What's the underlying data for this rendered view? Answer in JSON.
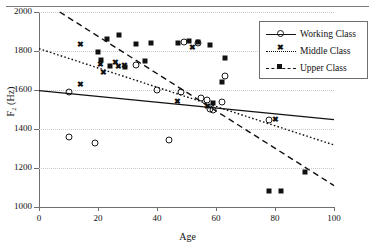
{
  "chart_data": {
    "type": "scatter",
    "title": "",
    "xlabel": "Age",
    "ylabel": "F2 (Hz)",
    "xlim": [
      0,
      100
    ],
    "ylim": [
      1000,
      2000
    ],
    "xticks": [
      0,
      20,
      40,
      60,
      80,
      100
    ],
    "yticks": [
      1000,
      1200,
      1400,
      1600,
      1800,
      2000
    ],
    "grid": true,
    "legend_position": "top-right",
    "series": [
      {
        "name": "Working Class",
        "marker": "open-circle",
        "line_style": "solid",
        "points": [
          {
            "x": 10,
            "y": 1592
          },
          {
            "x": 10,
            "y": 1358
          },
          {
            "x": 19,
            "y": 1327
          },
          {
            "x": 33,
            "y": 1729
          },
          {
            "x": 40,
            "y": 1598
          },
          {
            "x": 44,
            "y": 1345
          },
          {
            "x": 48,
            "y": 1588
          },
          {
            "x": 49,
            "y": 1847
          },
          {
            "x": 54,
            "y": 1840
          },
          {
            "x": 55,
            "y": 1560
          },
          {
            "x": 57,
            "y": 1548
          },
          {
            "x": 58,
            "y": 1502
          },
          {
            "x": 59,
            "y": 1498
          },
          {
            "x": 62,
            "y": 1537
          },
          {
            "x": 63,
            "y": 1672
          },
          {
            "x": 78,
            "y": 1448
          }
        ],
        "fit_line": {
          "x0": 0,
          "y0": 1597,
          "x1": 100,
          "y1": 1448
        }
      },
      {
        "name": "Middle Class",
        "marker": "cross",
        "line_style": "dotted",
        "points": [
          {
            "x": 14,
            "y": 1838
          },
          {
            "x": 14,
            "y": 1630
          },
          {
            "x": 21,
            "y": 1731
          },
          {
            "x": 22,
            "y": 1692
          },
          {
            "x": 26,
            "y": 1743
          },
          {
            "x": 27,
            "y": 1724
          },
          {
            "x": 29,
            "y": 1727
          },
          {
            "x": 47,
            "y": 1546
          },
          {
            "x": 52,
            "y": 1818
          },
          {
            "x": 57,
            "y": 1517
          },
          {
            "x": 80,
            "y": 1452
          }
        ],
        "fit_line": {
          "x0": 0,
          "y0": 1812,
          "x1": 100,
          "y1": 1318
        }
      },
      {
        "name": "Upper Class",
        "marker": "filled-square",
        "line_style": "dashed",
        "points": [
          {
            "x": 20,
            "y": 1797
          },
          {
            "x": 21,
            "y": 1752
          },
          {
            "x": 23,
            "y": 1859
          },
          {
            "x": 24,
            "y": 1722
          },
          {
            "x": 27,
            "y": 1884
          },
          {
            "x": 29,
            "y": 1719
          },
          {
            "x": 33,
            "y": 1838
          },
          {
            "x": 36,
            "y": 1748
          },
          {
            "x": 38,
            "y": 1841
          },
          {
            "x": 47,
            "y": 1843
          },
          {
            "x": 51,
            "y": 1849
          },
          {
            "x": 54,
            "y": 1845
          },
          {
            "x": 58,
            "y": 1832
          },
          {
            "x": 59,
            "y": 1534
          },
          {
            "x": 62,
            "y": 1641
          },
          {
            "x": 63,
            "y": 1762
          },
          {
            "x": 78,
            "y": 1081
          },
          {
            "x": 82,
            "y": 1082
          },
          {
            "x": 90,
            "y": 1182
          }
        ],
        "fit_line": {
          "x0": 7,
          "y0": 2000,
          "x1": 100,
          "y1": 1110
        }
      }
    ]
  },
  "legend": {
    "items": [
      {
        "label": "Working Class"
      },
      {
        "label": "Middle Class"
      },
      {
        "label": "Upper Class"
      }
    ]
  },
  "axes": {
    "x_title": "Age",
    "y_title": "F₂ (Hz)",
    "x_tick_labels": [
      "0",
      "20",
      "40",
      "60",
      "80",
      "100"
    ],
    "y_tick_labels": [
      "1000",
      "1200",
      "1400",
      "1600",
      "1800",
      "2000"
    ]
  }
}
